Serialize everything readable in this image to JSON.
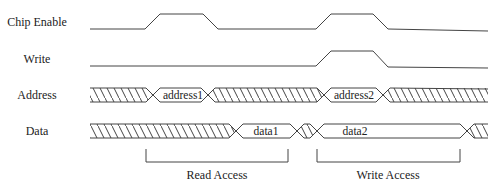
{
  "diagram": {
    "type": "timing-diagram",
    "signals": [
      {
        "name": "Chip Enable",
        "kind": "digital"
      },
      {
        "name": "Write",
        "kind": "digital"
      },
      {
        "name": "Address",
        "kind": "bus",
        "values": [
          "address1",
          "address2"
        ]
      },
      {
        "name": "Data",
        "kind": "bus",
        "values": [
          "data1",
          "data2"
        ]
      }
    ],
    "annotations": [
      {
        "label": "Read Access"
      },
      {
        "label": "Write Access"
      }
    ],
    "colors": {
      "line": "#444444",
      "background": "#ffffff",
      "text": "#222222"
    }
  },
  "labels": {
    "chip_enable": "Chip Enable",
    "write": "Write",
    "address": "Address",
    "data": "Data"
  },
  "bus_values": {
    "address1": "address1",
    "address2": "address2",
    "data1": "data1",
    "data2": "data2"
  },
  "brackets": {
    "read": "Read Access",
    "write": "Write Access"
  }
}
